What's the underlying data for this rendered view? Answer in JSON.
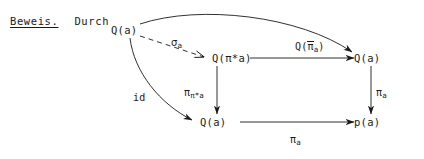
{
  "page": {
    "width": 424,
    "height": 159,
    "background": "#ffffff",
    "ink": "#1a1a1a"
  },
  "prose": {
    "proof_keyword": "Beweis.",
    "lead_text": "Durch"
  },
  "diagram": {
    "type": "commutative-diagram",
    "nodes": [
      {
        "id": "n_top",
        "label": "Q(a)",
        "x": 126,
        "y": 30
      },
      {
        "id": "n_mid_left",
        "label": "Q(π*a)",
        "x": 214,
        "y": 58
      },
      {
        "id": "n_right",
        "label": "Q(a)",
        "x": 363,
        "y": 58
      },
      {
        "id": "n_bottom_left",
        "label": "Q(a)",
        "x": 202,
        "y": 122
      },
      {
        "id": "n_bottom_right",
        "label": "p(a)",
        "x": 363,
        "y": 122
      }
    ],
    "edges": [
      {
        "id": "e_top_curve",
        "from": "n_top",
        "to": "n_right",
        "label": "",
        "style": "curved-solid"
      },
      {
        "id": "e_sigma",
        "from": "n_top",
        "to": "n_mid_left",
        "label": "σ",
        "sub": "a",
        "style": "dashed"
      },
      {
        "id": "e_id",
        "from": "n_top",
        "to": "n_bottom_left",
        "label": "id",
        "style": "curved-solid"
      },
      {
        "id": "e_qpibar",
        "from": "n_mid_left",
        "to": "n_right",
        "label": "Q(π",
        "sub": "a",
        "style": "straight-solid",
        "overline": true
      },
      {
        "id": "e_pi_pistar",
        "from": "n_mid_left",
        "to": "n_bottom_left",
        "label": "π",
        "sub": "π*a",
        "style": "straight-solid"
      },
      {
        "id": "e_pi_right",
        "from": "n_right",
        "to": "n_bottom_right",
        "label": "π",
        "sub": "a",
        "style": "straight-solid"
      },
      {
        "id": "e_pi_bottom",
        "from": "n_bottom_left",
        "to": "n_bottom_right",
        "label": "π",
        "sub": "a",
        "style": "straight-solid"
      }
    ],
    "labels": {
      "sigma_a_base": "σ",
      "sigma_a_sub": "a",
      "id": "id",
      "q_open": "Q(",
      "q_close": ")",
      "pi_bar": "π",
      "pi_bar_sub": "a",
      "pi_pistar_base": "π",
      "pi_pistar_sub": "π*a",
      "pi_right_base": "π",
      "pi_right_sub": "a",
      "pi_bottom_base": "π",
      "pi_bottom_sub": "a"
    }
  }
}
